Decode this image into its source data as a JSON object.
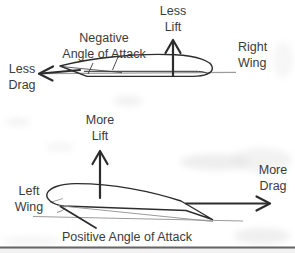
{
  "colors": {
    "background": "#ffffff",
    "text_ink": "#3b3b3b",
    "drawing_ink": "#2d2d2d",
    "reference_line_gray": "#9b9b9b",
    "page_edge_dark": "#585858",
    "scan_noise_gray": "#e0e0e0"
  },
  "top_diagram": {
    "wing_side": "Right Wing",
    "lift_label": {
      "line1": "Less",
      "line2": "Lift"
    },
    "aoa_label": {
      "line1": "Negative",
      "line2": "Angle of Attack"
    },
    "wing_label": {
      "line1": "Right",
      "line2": "Wing"
    },
    "drag_label": {
      "line1": "Less",
      "line2": "Drag"
    },
    "arrows": [
      {
        "name": "less-lift",
        "direction": "up"
      },
      {
        "name": "less-drag",
        "direction": "left"
      }
    ]
  },
  "bottom_diagram": {
    "wing_side": "Left Wing",
    "lift_label": {
      "line1": "More",
      "line2": "Lift"
    },
    "aoa_label": "Positive Angle of Attack",
    "wing_label": {
      "line1": "Left",
      "line2": "Wing"
    },
    "drag_label": {
      "line1": "More",
      "line2": "Drag"
    },
    "arrows": [
      {
        "name": "more-lift",
        "direction": "up"
      },
      {
        "name": "more-drag",
        "direction": "right"
      }
    ]
  }
}
